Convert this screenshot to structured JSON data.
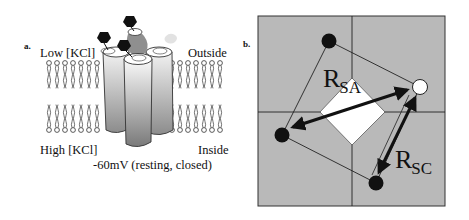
{
  "figure": {
    "panel_a": {
      "letter": "a.",
      "labels": {
        "top_left": "Low [KCl]",
        "top_right": "Outside",
        "bottom_left": "High [KCl]",
        "bottom_right": "Inside",
        "caption": "-60mV (resting, closed)"
      },
      "cys_label": "Cys",
      "colors": {
        "membrane_stroke": "#333333",
        "channel_light": "#eeeeee",
        "channel_dark": "#8a8a8a",
        "tag_black": "#111111",
        "tag_gray": "#888888",
        "tag_faint": "#dddddd"
      }
    },
    "panel_b": {
      "letter": "b.",
      "labels": {
        "r_sa_main": "R",
        "r_sa_sub": "SA",
        "r_sc_main": "R",
        "r_sc_sub": "SC"
      },
      "colors": {
        "background": "#b8b8b8",
        "diamond": "#ffffff",
        "dot_filled": "#111111",
        "dot_open": "#ffffff"
      }
    }
  }
}
